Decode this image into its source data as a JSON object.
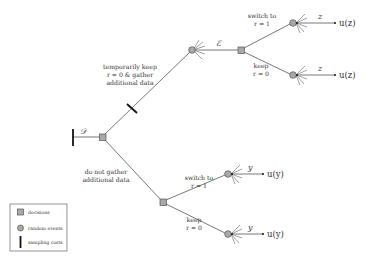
{
  "diagram": {
    "type": "decision-tree",
    "colors": {
      "node_fill": "#a9a9a9",
      "line": "#555555",
      "tick": "#111111"
    },
    "root": {
      "label": "𝒟",
      "kind": "decision"
    },
    "branches": {
      "gather": {
        "label_line1": "temporarily keep",
        "label_line2": "r  = 0 & gather",
        "label_line3": "additional data",
        "event_label": "ℰ",
        "has_sampling_cost": true
      },
      "no_gather": {
        "label_line1": "do not gather",
        "label_line2": "additional data"
      }
    },
    "upper_subtree": {
      "switch_label_line1": "switch to",
      "switch_label_line2": "r  = 1",
      "keep_label_line1": "keep",
      "keep_label_line2": "r  = 0",
      "outcome_var": "z",
      "utility_top": "u(z)",
      "utility_bottom": "u(z)"
    },
    "lower_subtree": {
      "switch_label_line1": "switch to",
      "switch_label_line2": "r  = 1",
      "keep_label_line1": "keep",
      "keep_label_line2": "r  = 0",
      "outcome_var": "y",
      "utility_top": "u(y)",
      "utility_bottom": "u(y)"
    }
  },
  "legend": {
    "items": [
      {
        "icon": "square-decision-icon",
        "label": "decisions"
      },
      {
        "icon": "circle-random-event-icon",
        "label": "random events"
      },
      {
        "icon": "sampling-cost-tick-icon",
        "label": "sampling costs"
      }
    ]
  }
}
